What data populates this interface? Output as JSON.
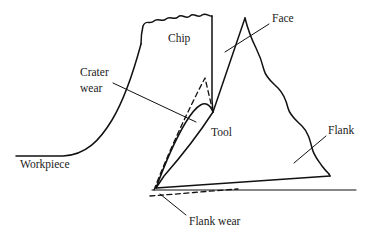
{
  "figure": {
    "type": "diagram",
    "background_color": "#ffffff",
    "line_color": "#111111"
  },
  "labels": {
    "workpiece": "Workpiece",
    "chip": "Chip",
    "crater_wear_line1": "Crater",
    "crater_wear_line2": "wear",
    "face": "Face",
    "tool": "Tool",
    "flank": "Flank",
    "flank_wear": "Flank wear"
  },
  "annotations": {
    "crater_wear_leader": "leader line from Crater wear text to rake face crater region",
    "face_leader": "leader line from Face text to tool rake face",
    "flank_leader": "leader line from Flank text to tool flank surface",
    "flank_wear_leader": "leader line from Flank wear text to worn flank land"
  },
  "geometry": {
    "chip_top_wave_count": 5,
    "tool_apex": [
      245,
      18
    ],
    "tool_tip": [
      156,
      188
    ],
    "dashed_elements": [
      "crater wear profile",
      "flank wear land"
    ]
  }
}
